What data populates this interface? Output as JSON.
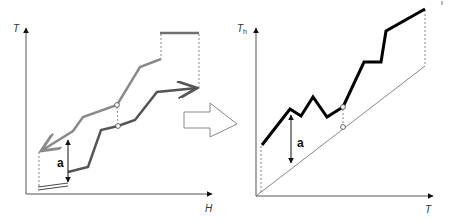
{
  "left_chart": {
    "y_axis_label": "T",
    "x_axis_label": "H",
    "annotation": "a",
    "axis": {
      "origin": [
        26,
        194
      ],
      "x_end": [
        216,
        194
      ],
      "y_end": [
        26,
        24
      ]
    },
    "hot_curve": {
      "name": "hot composite curve",
      "color": "#8a8a8a",
      "points": [
        [
          161,
          59
        ],
        [
          140,
          67
        ],
        [
          117,
          105
        ],
        [
          83,
          117
        ],
        [
          73,
          131
        ],
        [
          39,
          152
        ]
      ]
    },
    "cold_curve": {
      "name": "cold composite curve",
      "color": "#555555",
      "points": [
        [
          68,
          172
        ],
        [
          88,
          167
        ],
        [
          101,
          130
        ],
        [
          118,
          126
        ],
        [
          135,
          120
        ],
        [
          157,
          92
        ],
        [
          199,
          88
        ]
      ]
    },
    "hot_utility": {
      "color": "#707070",
      "x1": 160,
      "x2": 199,
      "y": 33
    },
    "cold_utility": {
      "x1": 38,
      "x2": 68,
      "y1": 189,
      "y2": 185
    },
    "pinch_points": [
      [
        117,
        105
      ],
      [
        118,
        126
      ]
    ],
    "a_arrow": {
      "x": 68,
      "y_top": 137,
      "y_bottom": 185
    }
  },
  "transition_arrow": {
    "direction": "right"
  },
  "right_chart": {
    "y_axis_label": "T",
    "y_axis_subscript": "h",
    "x_axis_label": "T",
    "annotation": "a",
    "axis": {
      "origin": [
        256,
        196
      ],
      "x_end": [
        436,
        196
      ],
      "y_end": [
        256,
        24
      ]
    },
    "diagonal": {
      "from": [
        256,
        196
      ],
      "to": [
        425,
        66
      ]
    },
    "shifted_curve": {
      "name": "hot temperature vs cold temperature",
      "color": "#000000",
      "points": [
        [
          262,
          145
        ],
        [
          290,
          109
        ],
        [
          301,
          116
        ],
        [
          313,
          97
        ],
        [
          327,
          117
        ],
        [
          343,
          107
        ],
        [
          364,
          62
        ],
        [
          381,
          62
        ],
        [
          386,
          31
        ],
        [
          425,
          9
        ]
      ]
    },
    "pinch_points": [
      [
        343,
        107
      ],
      [
        343,
        127
      ]
    ],
    "a_arrow": {
      "x": 291,
      "y_top": 112,
      "y_bottom": 165
    }
  }
}
